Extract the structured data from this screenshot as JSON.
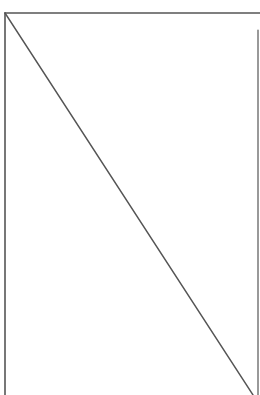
{
  "diagram": {
    "background": "#ffffff",
    "stroke_color": "#555555",
    "lines": [
      {
        "name": "top-edge",
        "x1": 5,
        "y1": 13,
        "x2": 260,
        "y2": 13,
        "width": 1.6
      },
      {
        "name": "left-edge",
        "x1": 5,
        "y1": 13,
        "x2": 5,
        "y2": 395,
        "width": 1.6
      },
      {
        "name": "right-edge",
        "x1": 258,
        "y1": 30,
        "x2": 258,
        "y2": 395,
        "width": 1.2
      },
      {
        "name": "diagonal",
        "x1": 5,
        "y1": 13,
        "x2": 253,
        "y2": 395,
        "width": 1.4
      }
    ]
  }
}
